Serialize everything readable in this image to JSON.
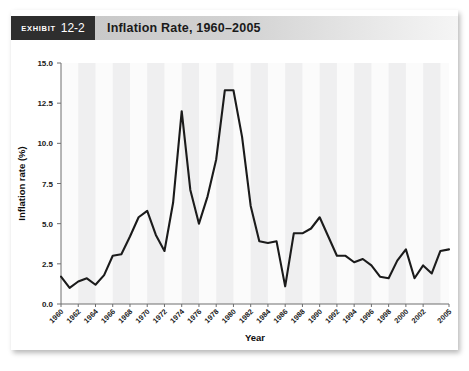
{
  "exhibit": {
    "tag_word": "Exhibit",
    "tag_number": "12-2",
    "title": "Inflation Rate, 1960–2005"
  },
  "chart_data": {
    "type": "line",
    "title": "Inflation Rate, 1960–2005",
    "xlabel": "Year",
    "ylabel": "Inflation rate (%)",
    "xlim": [
      1960,
      2005
    ],
    "ylim": [
      0.0,
      15.0
    ],
    "yticks": [
      "0.0",
      "2.5",
      "5.0",
      "7.5",
      "10.0",
      "12.5",
      "15.0"
    ],
    "ytick_values": [
      0.0,
      2.5,
      5.0,
      7.5,
      10.0,
      12.5,
      15.0
    ],
    "xticks": [
      "1960",
      "1962",
      "1964",
      "1966",
      "1968",
      "1970",
      "1972",
      "1974",
      "1976",
      "1978",
      "1980",
      "1982",
      "1984",
      "1986",
      "1988",
      "1990",
      "1992",
      "1994",
      "1996",
      "1998",
      "2000",
      "2002",
      "2005"
    ],
    "grid": false,
    "legend": "none",
    "banding": "alternating vertical light-gray bands",
    "line_color": "#1b1b1b",
    "x": [
      1960,
      1961,
      1962,
      1963,
      1964,
      1965,
      1966,
      1967,
      1968,
      1969,
      1970,
      1971,
      1972,
      1973,
      1974,
      1975,
      1976,
      1977,
      1978,
      1979,
      1980,
      1981,
      1982,
      1983,
      1984,
      1985,
      1986,
      1987,
      1988,
      1989,
      1990,
      1991,
      1992,
      1993,
      1994,
      1995,
      1996,
      1997,
      1998,
      1999,
      2000,
      2001,
      2002,
      2003,
      2004,
      2005
    ],
    "values": [
      1.7,
      1.0,
      1.4,
      1.6,
      1.2,
      1.8,
      3.0,
      3.1,
      4.2,
      5.4,
      5.8,
      4.3,
      3.3,
      6.3,
      12.0,
      7.1,
      5.0,
      6.7,
      9.0,
      13.3,
      13.3,
      10.4,
      6.1,
      3.9,
      3.8,
      3.9,
      1.1,
      4.4,
      4.4,
      4.7,
      5.4,
      4.2,
      3.0,
      3.0,
      2.6,
      2.8,
      2.4,
      1.7,
      1.6,
      2.7,
      3.4,
      1.6,
      2.4,
      1.9,
      3.3,
      3.4
    ],
    "annotations": {
      "peak_1974": 12.0,
      "peak_1980": 13.3,
      "trough_1986": 1.1,
      "trough_1961": 1.0
    }
  }
}
